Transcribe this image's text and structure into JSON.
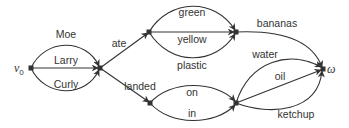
{
  "diagram": {
    "type": "directed-graph",
    "colors": {
      "stroke": "#333333",
      "background": "#ffffff"
    },
    "nodes": [
      {
        "id": "v0",
        "label": "v",
        "subscript": "0",
        "x": 31,
        "y": 68,
        "label_x": 14,
        "label_y": 72
      },
      {
        "id": "n1",
        "label": "",
        "x": 100,
        "y": 68
      },
      {
        "id": "n2",
        "label": "",
        "x": 149,
        "y": 32
      },
      {
        "id": "n3",
        "label": "",
        "x": 150,
        "y": 103
      },
      {
        "id": "n4",
        "label": "",
        "x": 236,
        "y": 32
      },
      {
        "id": "n5",
        "label": "",
        "x": 236,
        "y": 103
      },
      {
        "id": "omega",
        "label": "ω",
        "x": 323,
        "y": 69,
        "label_x": 327,
        "label_y": 73
      }
    ],
    "edges": [
      {
        "from": "v0",
        "to": "n1",
        "label": "Moe",
        "path": "M31,68 C45,38 86,38 99,66",
        "label_x": 66,
        "label_y": 38
      },
      {
        "from": "v0",
        "to": "n1",
        "label": "Larry",
        "path": "M31,68 L98,68",
        "label_x": 66,
        "label_y": 64
      },
      {
        "from": "v0",
        "to": "n1",
        "label": "Curly",
        "path": "M31,68 C45,98 86,98 99,70",
        "label_x": 66,
        "label_y": 88
      },
      {
        "from": "n1",
        "to": "n2",
        "label": "ate",
        "path": "M100,68 L148,33",
        "label_x": 119,
        "label_y": 47
      },
      {
        "from": "n1",
        "to": "n3",
        "label": "landed",
        "path": "M100,68 L149,102",
        "label_x": 140,
        "label_y": 90
      },
      {
        "from": "n2",
        "to": "n4",
        "label": "green",
        "path": "M149,32 C170,-2 215,-2 235,30",
        "label_x": 192,
        "label_y": 16
      },
      {
        "from": "n2",
        "to": "n4",
        "label": "yellow",
        "path": "M149,32 L234,32",
        "label_x": 192,
        "label_y": 43
      },
      {
        "from": "n2",
        "to": "n4",
        "label": "plastic",
        "path": "M149,32 C170,66 215,66 235,34",
        "label_x": 192,
        "label_y": 69
      },
      {
        "from": "n3",
        "to": "n5",
        "label": "on",
        "path": "M150,103 C170,80 215,80 235,101",
        "label_x": 192,
        "label_y": 96
      },
      {
        "from": "n3",
        "to": "n5",
        "label": "in",
        "path": "M150,103 C170,126 215,126 235,105",
        "label_x": 192,
        "label_y": 117
      },
      {
        "from": "n4",
        "to": "omega",
        "label": "bananas",
        "path": "M236,32 C280,30 312,40 322,67",
        "label_x": 277,
        "label_y": 27
      },
      {
        "from": "n5",
        "to": "omega",
        "label": "water",
        "path": "M236,103 C250,60 290,50 321,67",
        "label_x": 265,
        "label_y": 58
      },
      {
        "from": "n5",
        "to": "omega",
        "label": "oil",
        "path": "M236,103 L321,70",
        "label_x": 280,
        "label_y": 80
      },
      {
        "from": "n5",
        "to": "omega",
        "label": "ketchup",
        "path": "M236,103 C270,116 318,112 322,71",
        "label_x": 296,
        "label_y": 118
      }
    ]
  }
}
